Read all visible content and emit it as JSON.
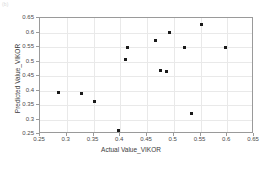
{
  "corner_mark": "(b)",
  "chart_data": {
    "type": "scatter",
    "title": "",
    "xlabel": "Actual Value_VIKOR",
    "ylabel": "Predicted Value_VIKOR",
    "xlim": [
      0.25,
      0.65
    ],
    "ylim": [
      0.25,
      0.65
    ],
    "xticks": [
      0.25,
      0.3,
      0.35,
      0.4,
      0.45,
      0.5,
      0.55,
      0.6,
      0.65
    ],
    "yticks": [
      0.25,
      0.3,
      0.35,
      0.4,
      0.45,
      0.5,
      0.55,
      0.6,
      0.65
    ],
    "xticklabels": [
      "0.25",
      "0.3",
      "0.35",
      "0.4",
      "0.45",
      "0.5",
      "0.55",
      "0.6",
      "0.65"
    ],
    "yticklabels": [
      "0.25",
      "0.3",
      "0.35",
      "0.4",
      "0.45",
      "0.5",
      "0.55",
      "0.6",
      "0.65"
    ],
    "grid": true,
    "legend": null,
    "marker_color": "#1a1a1a",
    "marker": "square",
    "points": [
      {
        "x": 0.285,
        "y": 0.392
      },
      {
        "x": 0.327,
        "y": 0.39
      },
      {
        "x": 0.352,
        "y": 0.362
      },
      {
        "x": 0.396,
        "y": 0.263
      },
      {
        "x": 0.41,
        "y": 0.508
      },
      {
        "x": 0.413,
        "y": 0.547
      },
      {
        "x": 0.466,
        "y": 0.574
      },
      {
        "x": 0.476,
        "y": 0.47
      },
      {
        "x": 0.487,
        "y": 0.465
      },
      {
        "x": 0.492,
        "y": 0.601
      },
      {
        "x": 0.52,
        "y": 0.55
      },
      {
        "x": 0.534,
        "y": 0.32
      },
      {
        "x": 0.552,
        "y": 0.627
      },
      {
        "x": 0.596,
        "y": 0.548
      }
    ]
  }
}
